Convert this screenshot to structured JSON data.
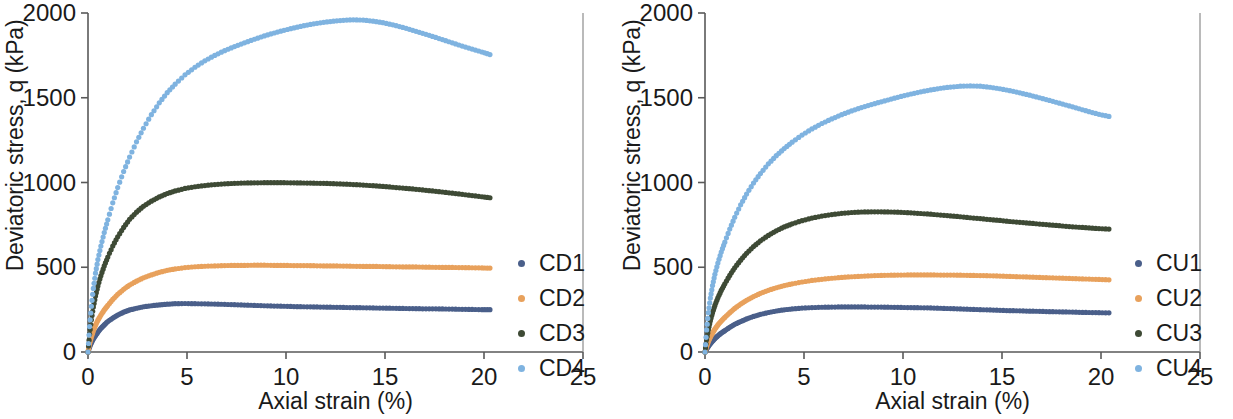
{
  "figure": {
    "panels": [
      {
        "id": "cd",
        "name": "drained-triaxial-panel",
        "chart_index": 0
      },
      {
        "id": "cu",
        "name": "undrained-triaxial-panel",
        "chart_index": 1
      }
    ]
  },
  "chart_data": [
    {
      "type": "scatter",
      "title": "",
      "xlabel": "Axial strain (%)",
      "ylabel": "Deviatoric stress, q (kPa)",
      "xlim": [
        0,
        25
      ],
      "ylim": [
        0,
        2000
      ],
      "xticks": [
        0,
        5,
        10,
        15,
        20,
        25
      ],
      "yticks": [
        0,
        500,
        1000,
        1500,
        2000
      ],
      "xtick_labels": [
        "0",
        "5",
        "10",
        "15",
        "20",
        "25"
      ],
      "ytick_labels": [
        "0",
        "500",
        "1000",
        "1500",
        "2000"
      ],
      "grid": false,
      "legend_position": "right",
      "series": [
        {
          "name": "CD1",
          "color": "#4a5f8a",
          "x": [
            0.0,
            0.08,
            0.17,
            0.27,
            0.38,
            0.5,
            0.65,
            0.82,
            1.0,
            1.25,
            1.5,
            1.8,
            2.1,
            2.45,
            2.8,
            3.2,
            3.6,
            4.0,
            4.4,
            4.9,
            5.4,
            5.9,
            6.4,
            6.9,
            7.4,
            7.9,
            8.4,
            8.9,
            9.4,
            9.9,
            10.4,
            10.9,
            11.4,
            11.9,
            12.4,
            12.9,
            13.4,
            13.9,
            14.4,
            14.9,
            15.4,
            15.9,
            16.4,
            16.9,
            17.4,
            17.9,
            18.4,
            18.9,
            19.4,
            19.9,
            20.3
          ],
          "y": [
            0,
            30,
            55,
            78,
            98,
            118,
            140,
            160,
            180,
            200,
            218,
            235,
            248,
            258,
            267,
            273,
            278,
            282,
            285,
            286,
            285,
            284,
            283,
            281,
            279,
            277,
            275,
            273,
            271,
            270,
            268,
            267,
            266,
            265,
            264,
            263,
            262,
            261,
            260,
            259,
            258,
            257,
            256,
            255,
            255,
            254,
            253,
            252,
            251,
            250,
            250
          ]
        },
        {
          "name": "CD2",
          "color": "#e8a15c",
          "x": [
            0.0,
            0.08,
            0.17,
            0.27,
            0.38,
            0.5,
            0.65,
            0.82,
            1.0,
            1.25,
            1.5,
            1.8,
            2.1,
            2.45,
            2.8,
            3.2,
            3.6,
            4.0,
            4.4,
            4.9,
            5.4,
            5.9,
            6.4,
            6.9,
            7.4,
            7.9,
            8.4,
            8.9,
            9.4,
            9.9,
            10.4,
            10.9,
            11.4,
            11.9,
            12.4,
            12.9,
            13.4,
            13.9,
            14.4,
            14.9,
            15.4,
            15.9,
            16.4,
            16.9,
            17.4,
            17.9,
            18.4,
            18.9,
            19.4,
            19.9,
            20.3
          ],
          "y": [
            0,
            48,
            88,
            125,
            158,
            188,
            218,
            248,
            275,
            310,
            340,
            370,
            395,
            418,
            438,
            455,
            470,
            482,
            490,
            498,
            503,
            506,
            508,
            510,
            511,
            511,
            512,
            512,
            511,
            511,
            510,
            510,
            509,
            508,
            508,
            507,
            506,
            505,
            505,
            504,
            503,
            502,
            502,
            501,
            500,
            499,
            499,
            498,
            497,
            496,
            495
          ]
        },
        {
          "name": "CD3",
          "color": "#3e4a35",
          "x": [
            0.0,
            0.08,
            0.17,
            0.27,
            0.38,
            0.5,
            0.65,
            0.82,
            1.0,
            1.25,
            1.5,
            1.8,
            2.1,
            2.45,
            2.8,
            3.2,
            3.6,
            4.0,
            4.4,
            4.9,
            5.4,
            5.9,
            6.4,
            6.9,
            7.4,
            7.9,
            8.4,
            8.9,
            9.4,
            9.9,
            10.4,
            10.9,
            11.4,
            11.9,
            12.4,
            12.9,
            13.4,
            13.9,
            14.4,
            14.9,
            15.4,
            15.9,
            16.4,
            16.9,
            17.4,
            17.9,
            18.4,
            18.9,
            19.4,
            19.9,
            20.3
          ],
          "y": [
            0,
            105,
            190,
            265,
            330,
            390,
            450,
            508,
            560,
            625,
            680,
            735,
            783,
            825,
            860,
            890,
            915,
            935,
            950,
            965,
            975,
            982,
            988,
            992,
            995,
            997,
            998,
            999,
            999,
            999,
            998,
            997,
            996,
            995,
            993,
            991,
            988,
            985,
            981,
            977,
            972,
            967,
            962,
            956,
            950,
            944,
            937,
            930,
            923,
            916,
            910
          ]
        },
        {
          "name": "CD4",
          "color": "#7fb3e0",
          "x": [
            0.0,
            0.08,
            0.17,
            0.27,
            0.38,
            0.5,
            0.65,
            0.82,
            1.0,
            1.25,
            1.5,
            1.8,
            2.1,
            2.45,
            2.8,
            3.2,
            3.6,
            4.0,
            4.4,
            4.9,
            5.4,
            5.9,
            6.4,
            6.9,
            7.4,
            7.9,
            8.4,
            8.9,
            9.4,
            9.9,
            10.4,
            10.9,
            11.4,
            11.9,
            12.4,
            12.9,
            13.4,
            13.9,
            14.4,
            14.9,
            15.4,
            15.9,
            16.4,
            16.9,
            17.4,
            17.9,
            18.4,
            18.9,
            19.4,
            19.9,
            20.3
          ],
          "y": [
            0,
            150,
            270,
            375,
            465,
            545,
            625,
            705,
            780,
            880,
            970,
            1065,
            1150,
            1240,
            1320,
            1400,
            1470,
            1530,
            1580,
            1635,
            1680,
            1718,
            1750,
            1778,
            1802,
            1824,
            1845,
            1865,
            1882,
            1898,
            1912,
            1925,
            1936,
            1945,
            1952,
            1957,
            1960,
            1958,
            1952,
            1943,
            1930,
            1915,
            1898,
            1880,
            1862,
            1843,
            1824,
            1805,
            1787,
            1770,
            1755
          ]
        }
      ],
      "legend": [
        {
          "label": "CD1",
          "color": "#4a5f8a"
        },
        {
          "label": "CD2",
          "color": "#e8a15c"
        },
        {
          "label": "CD3",
          "color": "#3e4a35"
        },
        {
          "label": "CD4",
          "color": "#7fb3e0"
        }
      ]
    },
    {
      "type": "scatter",
      "title": "",
      "xlabel": "Axial strain (%)",
      "ylabel": "Deviatoric stress, q (kPa)",
      "xlim": [
        0,
        25
      ],
      "ylim": [
        0,
        2000
      ],
      "xticks": [
        0,
        5,
        10,
        15,
        20,
        25
      ],
      "yticks": [
        0,
        500,
        1000,
        1500,
        2000
      ],
      "xtick_labels": [
        "0",
        "5",
        "10",
        "15",
        "20",
        "25"
      ],
      "ytick_labels": [
        "0",
        "500",
        "1000",
        "1500",
        "2000"
      ],
      "grid": false,
      "legend_position": "right",
      "series": [
        {
          "name": "CU1",
          "color": "#4a5f8a",
          "x": [
            0.0,
            0.08,
            0.17,
            0.27,
            0.38,
            0.5,
            0.65,
            0.82,
            1.0,
            1.25,
            1.5,
            1.8,
            2.1,
            2.45,
            2.8,
            3.2,
            3.6,
            4.0,
            4.4,
            4.9,
            5.4,
            5.9,
            6.4,
            6.9,
            7.4,
            7.9,
            8.4,
            8.9,
            9.4,
            9.9,
            10.4,
            10.9,
            11.4,
            11.9,
            12.4,
            12.9,
            13.4,
            13.9,
            14.4,
            14.9,
            15.4,
            15.9,
            16.4,
            16.9,
            17.4,
            17.9,
            18.4,
            18.9,
            19.4,
            19.9,
            20.4
          ],
          "y": [
            0,
            18,
            34,
            50,
            65,
            80,
            96,
            112,
            126,
            146,
            163,
            180,
            195,
            210,
            222,
            233,
            242,
            249,
            254,
            259,
            262,
            264,
            265,
            266,
            266,
            266,
            265,
            265,
            264,
            263,
            262,
            261,
            260,
            258,
            256,
            254,
            252,
            250,
            248,
            246,
            244,
            243,
            241,
            240,
            238,
            237,
            236,
            234,
            233,
            232,
            231
          ]
        },
        {
          "name": "CU2",
          "color": "#e8a15c",
          "x": [
            0.0,
            0.08,
            0.17,
            0.27,
            0.38,
            0.5,
            0.65,
            0.82,
            1.0,
            1.25,
            1.5,
            1.8,
            2.1,
            2.45,
            2.8,
            3.2,
            3.6,
            4.0,
            4.4,
            4.9,
            5.4,
            5.9,
            6.4,
            6.9,
            7.4,
            7.9,
            8.4,
            8.9,
            9.4,
            9.9,
            10.4,
            10.9,
            11.4,
            11.9,
            12.4,
            12.9,
            13.4,
            13.9,
            14.4,
            14.9,
            15.4,
            15.9,
            16.4,
            16.9,
            17.4,
            17.9,
            18.4,
            18.9,
            19.4,
            19.9,
            20.4
          ],
          "y": [
            0,
            33,
            62,
            88,
            112,
            135,
            160,
            183,
            204,
            232,
            257,
            283,
            305,
            327,
            346,
            364,
            379,
            392,
            402,
            413,
            422,
            429,
            435,
            440,
            444,
            447,
            450,
            452,
            453,
            454,
            455,
            455,
            455,
            454,
            454,
            453,
            452,
            451,
            450,
            448,
            446,
            444,
            442,
            440,
            438,
            436,
            434,
            432,
            430,
            428,
            426
          ]
        },
        {
          "name": "CU3",
          "color": "#3e4a35",
          "x": [
            0.0,
            0.08,
            0.17,
            0.27,
            0.38,
            0.5,
            0.65,
            0.82,
            1.0,
            1.25,
            1.5,
            1.8,
            2.1,
            2.45,
            2.8,
            3.2,
            3.6,
            4.0,
            4.4,
            4.9,
            5.4,
            5.9,
            6.4,
            6.9,
            7.4,
            7.9,
            8.4,
            8.9,
            9.4,
            9.9,
            10.4,
            10.9,
            11.4,
            11.9,
            12.4,
            12.9,
            13.4,
            13.9,
            14.4,
            14.9,
            15.4,
            15.9,
            16.4,
            16.9,
            17.4,
            17.9,
            18.4,
            18.9,
            19.4,
            19.9,
            20.4
          ],
          "y": [
            0,
            72,
            132,
            185,
            232,
            275,
            320,
            363,
            402,
            452,
            497,
            542,
            582,
            622,
            656,
            688,
            715,
            738,
            756,
            775,
            790,
            802,
            811,
            818,
            823,
            826,
            827,
            827,
            826,
            824,
            821,
            817,
            813,
            808,
            803,
            798,
            792,
            787,
            781,
            776,
            770,
            765,
            760,
            755,
            750,
            745,
            740,
            736,
            732,
            728,
            725
          ]
        },
        {
          "name": "CU4",
          "color": "#7fb3e0",
          "x": [
            0.0,
            0.08,
            0.17,
            0.27,
            0.38,
            0.5,
            0.65,
            0.82,
            1.0,
            1.25,
            1.5,
            1.8,
            2.1,
            2.45,
            2.8,
            3.2,
            3.6,
            4.0,
            4.4,
            4.9,
            5.4,
            5.9,
            6.4,
            6.9,
            7.4,
            7.9,
            8.4,
            8.9,
            9.4,
            9.9,
            10.4,
            10.9,
            11.4,
            11.9,
            12.4,
            12.9,
            13.4,
            13.9,
            14.4,
            14.9,
            15.4,
            15.9,
            16.4,
            16.9,
            17.4,
            17.9,
            18.4,
            18.9,
            19.4,
            19.9,
            20.4
          ],
          "y": [
            0,
            130,
            232,
            318,
            392,
            458,
            525,
            590,
            648,
            725,
            795,
            868,
            932,
            997,
            1053,
            1110,
            1158,
            1200,
            1238,
            1280,
            1316,
            1348,
            1375,
            1400,
            1422,
            1442,
            1460,
            1476,
            1492,
            1508,
            1522,
            1535,
            1546,
            1556,
            1563,
            1568,
            1570,
            1568,
            1562,
            1553,
            1542,
            1529,
            1515,
            1500,
            1484,
            1468,
            1452,
            1435,
            1418,
            1402,
            1390
          ]
        }
      ],
      "legend": [
        {
          "label": "CU1",
          "color": "#4a5f8a"
        },
        {
          "label": "CU2",
          "color": "#e8a15c"
        },
        {
          "label": "CU3",
          "color": "#3e4a35"
        },
        {
          "label": "CU4",
          "color": "#7fb3e0"
        }
      ]
    }
  ]
}
